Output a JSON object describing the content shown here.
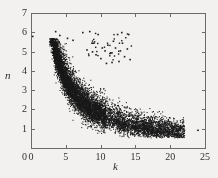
{
  "chart_data": {
    "type": "scatter",
    "title": "",
    "xlabel": "k",
    "ylabel": "n",
    "xlim": [
      0,
      25
    ],
    "ylim": [
      0,
      7
    ],
    "xticks": [
      0,
      5,
      10,
      15,
      20,
      25
    ],
    "yticks": [
      0,
      1,
      2,
      3,
      4,
      5,
      6,
      7
    ],
    "grid": false,
    "legend": null,
    "marker": {
      "shape": "dot",
      "color": "#1a1a1a",
      "size": 1.2
    },
    "background_color": "#f2f1ef",
    "axis_color": "#6b6b6b",
    "series": [
      {
        "name": "main-cluster",
        "point_count": 5200,
        "distribution": "hyperbolic-band",
        "band": {
          "k_min": 2.6,
          "k_max": 22.0,
          "curve_center": "n = 17.5 / k",
          "band_half_width_n": 0.55,
          "density_peak_k": 6.0
        },
        "sample_points": [
          [
            3.0,
            5.4
          ],
          [
            3.2,
            4.9
          ],
          [
            3.4,
            5.2
          ],
          [
            3.6,
            4.6
          ],
          [
            3.8,
            5.0
          ],
          [
            4.0,
            4.4
          ],
          [
            4.2,
            4.8
          ],
          [
            4.4,
            4.2
          ],
          [
            4.6,
            4.5
          ],
          [
            4.8,
            3.9
          ],
          [
            5.0,
            4.1
          ],
          [
            5.2,
            3.7
          ],
          [
            5.4,
            3.9
          ],
          [
            5.6,
            3.5
          ],
          [
            5.8,
            3.6
          ],
          [
            6.0,
            3.3
          ],
          [
            6.4,
            3.1
          ],
          [
            6.8,
            3.0
          ],
          [
            7.2,
            2.8
          ],
          [
            7.6,
            2.7
          ],
          [
            8.0,
            2.6
          ],
          [
            8.5,
            2.4
          ],
          [
            9.0,
            2.3
          ],
          [
            9.5,
            2.2
          ],
          [
            10.0,
            2.1
          ],
          [
            10.5,
            2.0
          ],
          [
            11.0,
            1.9
          ],
          [
            11.5,
            1.85
          ],
          [
            12.0,
            1.8
          ],
          [
            12.5,
            1.7
          ],
          [
            13.0,
            1.65
          ],
          [
            13.5,
            1.6
          ],
          [
            14.0,
            1.5
          ],
          [
            15.0,
            1.4
          ],
          [
            16.0,
            1.3
          ],
          [
            17.0,
            1.2
          ],
          [
            18.0,
            1.15
          ],
          [
            19.0,
            1.1
          ],
          [
            20.0,
            1.0
          ],
          [
            21.0,
            1.0
          ],
          [
            22.0,
            0.95
          ],
          [
            23.9,
            0.95
          ]
        ]
      },
      {
        "name": "upper-outliers",
        "point_count": 48,
        "distribution": "sparse-cloud",
        "sample_points": [
          [
            0.2,
            5.8
          ],
          [
            3.5,
            6.05
          ],
          [
            4.1,
            5.85
          ],
          [
            8.4,
            6.05
          ],
          [
            9.0,
            5.45
          ],
          [
            9.6,
            5.9
          ],
          [
            10.2,
            5.2
          ],
          [
            10.6,
            5.05
          ],
          [
            11.0,
            5.35
          ],
          [
            11.4,
            4.95
          ],
          [
            11.8,
            5.55
          ],
          [
            12.1,
            5.2
          ],
          [
            12.4,
            5.9
          ],
          [
            12.8,
            5.05
          ],
          [
            13.1,
            5.45
          ],
          [
            13.4,
            4.75
          ],
          [
            13.8,
            5.15
          ],
          [
            14.2,
            4.6
          ],
          [
            8.0,
            5.1
          ],
          [
            8.8,
            5.0
          ],
          [
            9.3,
            4.85
          ],
          [
            10.0,
            4.65
          ],
          [
            10.8,
            4.4
          ],
          [
            11.6,
            4.45
          ],
          [
            12.6,
            4.5
          ],
          [
            7.4,
            6.0
          ],
          [
            6.0,
            5.6
          ],
          [
            5.2,
            5.7
          ],
          [
            14.0,
            5.9
          ],
          [
            13.0,
            6.0
          ]
        ]
      }
    ]
  },
  "axes": {
    "x_tick_labels": [
      "0",
      "5",
      "10",
      "15",
      "20",
      "25"
    ],
    "y_tick_labels": [
      "0",
      "1",
      "2",
      "3",
      "4",
      "5",
      "6",
      "7"
    ],
    "x_axis_title": "k",
    "y_axis_title": "n"
  }
}
